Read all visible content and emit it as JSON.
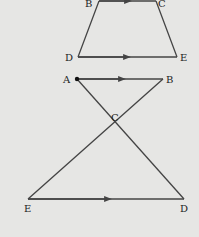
{
  "figure1": {
    "title": "trapezoid BCDE with BC parallel to DE",
    "labels": {
      "B": "B",
      "C": "C",
      "D": "D",
      "E": "E"
    }
  },
  "figure2": {
    "title": "crossed triangles with AB parallel to ED",
    "labels": {
      "A": "A",
      "B": "B",
      "C": "C",
      "D": "D",
      "E": "E"
    }
  },
  "colors": {
    "background": "#e6e6e4",
    "line": "#444444"
  }
}
